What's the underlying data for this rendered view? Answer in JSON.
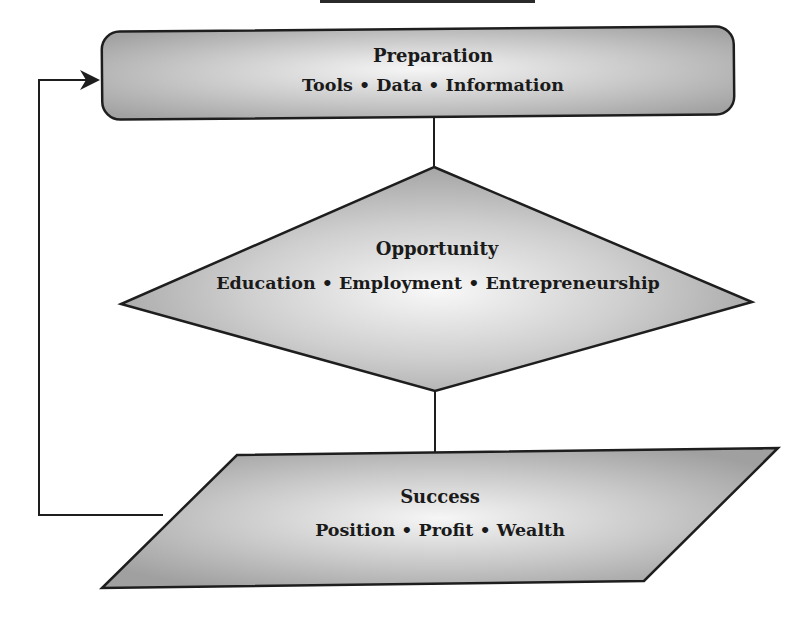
{
  "diagram": {
    "type": "flowchart",
    "colors": {
      "fill_light": "#f4f4f4",
      "fill_dark": "#9f9f9f",
      "stroke": "#1e1e1e",
      "text": "#1a1a1a"
    },
    "nodes": [
      {
        "id": "preparation",
        "shape": "rounded-rectangle",
        "title": "Preparation",
        "subtitle": "Tools • Data • Information"
      },
      {
        "id": "opportunity",
        "shape": "diamond",
        "title": "Opportunity",
        "subtitle": "Education • Employment • Entrepreneurship"
      },
      {
        "id": "success",
        "shape": "parallelogram",
        "title": "Success",
        "subtitle": "Position • Profit • Wealth"
      }
    ],
    "edges": [
      {
        "from": "preparation",
        "to": "opportunity",
        "style": "line"
      },
      {
        "from": "opportunity",
        "to": "success",
        "style": "line"
      },
      {
        "from": "success",
        "to": "preparation",
        "style": "arrow",
        "route": "left-loop"
      }
    ]
  }
}
